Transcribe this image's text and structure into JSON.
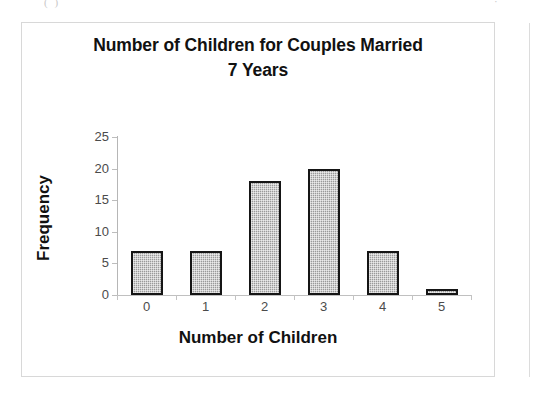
{
  "page": {
    "scan_marks": {
      "left": "( )",
      "right": "·"
    }
  },
  "chart": {
    "title_line1": "Number of Children for Couples Married",
    "title_line2": "7 Years",
    "x_axis_title": "Number of Children",
    "y_axis_title": "Frequency"
  },
  "chart_data": {
    "type": "bar",
    "title": "Number of Children for Couples Married 7 Years",
    "xlabel": "Number of Children",
    "ylabel": "Frequency",
    "categories": [
      "0",
      "1",
      "2",
      "3",
      "4",
      "5"
    ],
    "values": [
      7,
      7,
      18,
      20,
      7,
      1
    ],
    "ylim": [
      0,
      25
    ],
    "ytick_labels": [
      "0",
      "5",
      "10",
      "15",
      "20",
      "25"
    ],
    "ytick_values": [
      0,
      5,
      10,
      15,
      20,
      25
    ],
    "ytick_interval": 5,
    "grid": false,
    "legend": "none",
    "bar_fill_color": "#9a9a9a",
    "bar_border_color": "#151515",
    "axis_color": "#bdbdbd",
    "plot_background": "#ffffff"
  }
}
